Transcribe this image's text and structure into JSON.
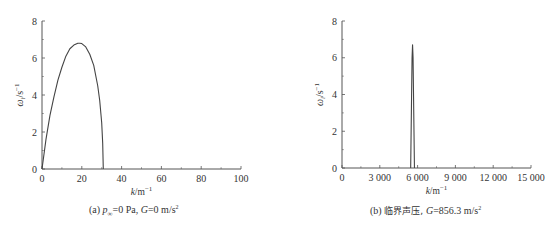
{
  "chart_data": [
    {
      "type": "line",
      "panel": "a",
      "title": "",
      "caption": "(a) p∞=0 Pa, G=0 m/s²",
      "caption_parts": {
        "label": "(a)",
        "var1": "p",
        "sub1": "∞",
        "rest1": "=0 Pa, ",
        "var2": "G",
        "rest2": "=0 m/s",
        "sup": "2"
      },
      "xlabel": "k/m⁻¹",
      "ylabel": "ωᵢ/s⁻¹",
      "xlim": [
        0,
        100
      ],
      "ylim": [
        0,
        8
      ],
      "xticks": [
        "0",
        "20",
        "40",
        "60",
        "80",
        "100"
      ],
      "yticks": [
        "0",
        "2",
        "4",
        "6",
        "8"
      ],
      "grid": false,
      "series": [
        {
          "name": "growth rate",
          "x": [
            0,
            2,
            4,
            6,
            8,
            10,
            12,
            14,
            16,
            18,
            19,
            20,
            22,
            24,
            26,
            28,
            29,
            30,
            30.5,
            30.8
          ],
          "y": [
            0,
            1.6,
            2.9,
            3.9,
            4.8,
            5.5,
            6.1,
            6.5,
            6.7,
            6.8,
            6.8,
            6.78,
            6.6,
            6.2,
            5.6,
            4.5,
            3.7,
            2.5,
            1.4,
            0
          ]
        }
      ]
    },
    {
      "type": "line",
      "panel": "b",
      "title": "",
      "caption": "(b) 临界声压, G=856.3 m/s²",
      "caption_parts": {
        "label": "(b)",
        "text": "临界声压, ",
        "var2": "G",
        "rest2": "=856.3 m/s",
        "sup": "2"
      },
      "xlabel": "k/m⁻¹",
      "ylabel": "ωᵢ/s⁻¹",
      "xlim": [
        0,
        15000
      ],
      "ylim": [
        0,
        8
      ],
      "xticks": [
        "0",
        "3 000",
        "6 000",
        "9 000",
        "12 000",
        "15 000"
      ],
      "yticks": [
        "0",
        "2",
        "4",
        "6",
        "8"
      ],
      "grid": false,
      "series": [
        {
          "name": "growth rate",
          "x": [
            5450,
            5560,
            5600,
            5640,
            5750
          ],
          "y": [
            0,
            6.0,
            6.7,
            6.0,
            0
          ]
        }
      ]
    }
  ]
}
